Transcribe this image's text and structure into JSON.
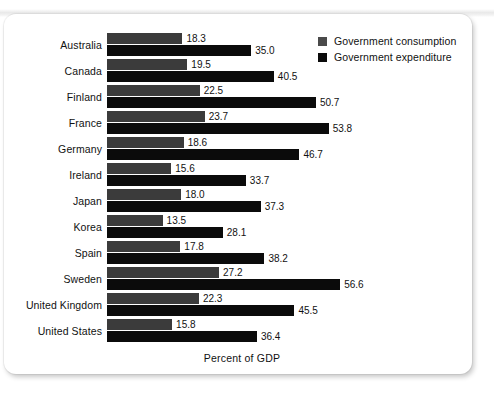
{
  "chart_data": {
    "type": "bar",
    "orientation": "horizontal",
    "title": "",
    "xlabel": "Percent of GDP",
    "ylabel": "",
    "xlim": [
      0,
      60
    ],
    "grid": false,
    "legend_position": "top-right",
    "categories": [
      "Australia",
      "Canada",
      "Finland",
      "France",
      "Germany",
      "Ireland",
      "Japan",
      "Korea",
      "Spain",
      "Sweden",
      "United Kingdom",
      "United States"
    ],
    "series": [
      {
        "name": "Government consumption",
        "color": "#3b3b3b",
        "values": [
          18.3,
          19.5,
          22.5,
          23.7,
          18.6,
          15.6,
          18.0,
          13.5,
          17.8,
          27.2,
          22.3,
          15.8
        ],
        "labels": [
          "18.3",
          "19.5",
          "22.5",
          "23.7",
          "18.6",
          "15.6",
          "18.0",
          "13.5",
          "17.8",
          "27.2",
          "22.3",
          "15.8"
        ]
      },
      {
        "name": "Government expenditure",
        "color": "#0b0b0b",
        "values": [
          35.0,
          40.5,
          50.7,
          53.8,
          46.7,
          33.7,
          37.3,
          28.1,
          38.2,
          56.6,
          45.5,
          36.4
        ],
        "labels": [
          "35.0",
          "40.5",
          "50.7",
          "53.8",
          "46.7",
          "33.7",
          "37.3",
          "28.1",
          "38.2",
          "56.6",
          "45.5",
          "36.4"
        ]
      }
    ]
  },
  "legend": {
    "items": [
      {
        "label": "Government consumption",
        "swatch": "consumption"
      },
      {
        "label": "Government expenditure",
        "swatch": "expenditure"
      }
    ]
  },
  "axis": {
    "x_title": "Percent of GDP"
  },
  "colors": {
    "consumption": "#3b3b3b",
    "expenditure": "#0b0b0b",
    "card_background": "#ffffff",
    "text": "#111111"
  },
  "scale": {
    "pixels_per_unit": 4.12,
    "bar_origin_x": 0
  }
}
